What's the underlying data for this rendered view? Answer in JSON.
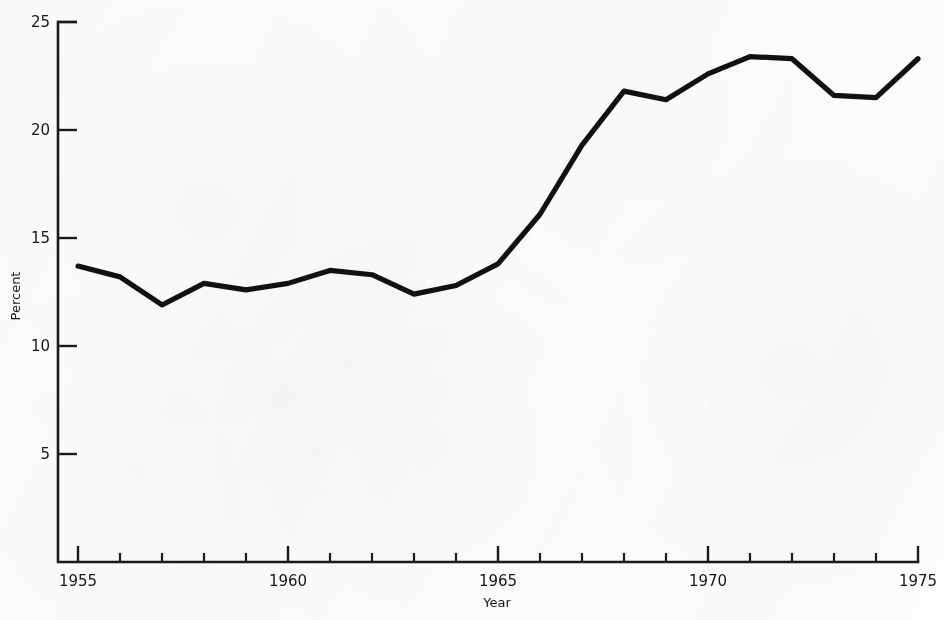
{
  "chart_data": {
    "type": "line",
    "title": "",
    "xlabel": "Year",
    "ylabel": "Percent",
    "xlim": [
      1955,
      1975
    ],
    "ylim": [
      0,
      25
    ],
    "grid": false,
    "legend": null,
    "y_ticks": [
      5,
      10,
      15,
      20,
      25
    ],
    "y_tick_labels": [
      "5",
      "10",
      "15",
      "20",
      "25"
    ],
    "x_ticks": [
      1955,
      1956,
      1957,
      1958,
      1959,
      1960,
      1961,
      1962,
      1963,
      1964,
      1965,
      1966,
      1967,
      1968,
      1969,
      1970,
      1971,
      1972,
      1973,
      1974,
      1975
    ],
    "x_tick_labels": [
      "1955",
      "1960",
      "1965",
      "1970",
      "1975"
    ],
    "x_labeled_ticks": [
      1955,
      1960,
      1965,
      1970,
      1975
    ],
    "x": [
      1955,
      1956,
      1957,
      1958,
      1959,
      1960,
      1961,
      1962,
      1963,
      1964,
      1965,
      1966,
      1967,
      1968,
      1969,
      1970,
      1971,
      1972,
      1973,
      1974,
      1975
    ],
    "values": [
      13.7,
      13.2,
      11.9,
      12.9,
      12.6,
      12.9,
      13.5,
      13.3,
      12.4,
      12.8,
      13.8,
      16.1,
      19.3,
      21.8,
      21.4,
      22.6,
      23.4,
      23.3,
      21.6,
      21.5,
      23.3
    ],
    "series": [
      {
        "name": "Percent",
        "color": "#111111",
        "values": [
          13.7,
          13.2,
          11.9,
          12.9,
          12.6,
          12.9,
          13.5,
          13.3,
          12.4,
          12.8,
          13.8,
          16.1,
          19.3,
          21.8,
          21.4,
          22.6,
          23.4,
          23.3,
          21.6,
          21.5,
          23.3
        ]
      }
    ],
    "annotations": []
  },
  "figure": {
    "background_color": "#fdfdfc",
    "line_color": "#111111",
    "axis_color": "#1a1a1a"
  }
}
